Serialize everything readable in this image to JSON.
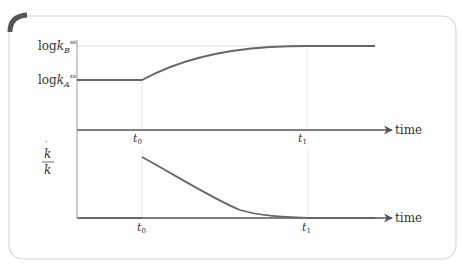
{
  "colors": {
    "panel_border": "#d6d6d6",
    "corner_accent": "#555555",
    "axis": "#666666",
    "curve": "#666666",
    "guide": "#e0e0e0",
    "text": "#333333"
  },
  "top_panel": {
    "y_labels": {
      "kB": {
        "prefix": "log",
        "var": "k",
        "sub": "B",
        "sup": "ss"
      },
      "kA": {
        "prefix": "log",
        "var": "k",
        "sub": "A",
        "sup": "ss"
      }
    },
    "x_axis_label": "time",
    "ticks": [
      {
        "var": "t",
        "sub": "0"
      },
      {
        "var": "t",
        "sub": "1"
      }
    ],
    "curve_description": "flat at log kA^ss until t0, then concave rise approaching log kB^ss, reaching it at t1"
  },
  "bottom_panel": {
    "y_label": {
      "numerator": "k",
      "numerator_dot": "˙",
      "denominator": "k"
    },
    "x_axis_label": "time",
    "ticks": [
      {
        "var": "t",
        "sub": "0"
      },
      {
        "var": "t",
        "sub": "1"
      }
    ],
    "curve_description": "zero until t0, jumps up at t0, then decays convexly back to zero around t1"
  }
}
